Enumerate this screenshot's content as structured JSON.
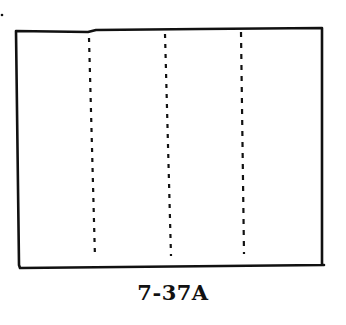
{
  "figure": {
    "caption": "7-37A",
    "stroke_color": "#111111",
    "background": "#ffffff",
    "rectangle": {
      "x1": 15,
      "y1": 30,
      "x2": 322,
      "y2": 266
    },
    "fold_lines": [
      {
        "style": "dashed",
        "x_top": 89,
        "x_bottom": 95
      },
      {
        "style": "dashed",
        "x_top": 165,
        "x_bottom": 171
      },
      {
        "style": "dashed",
        "x_top": 240,
        "x_bottom": 244
      }
    ]
  }
}
